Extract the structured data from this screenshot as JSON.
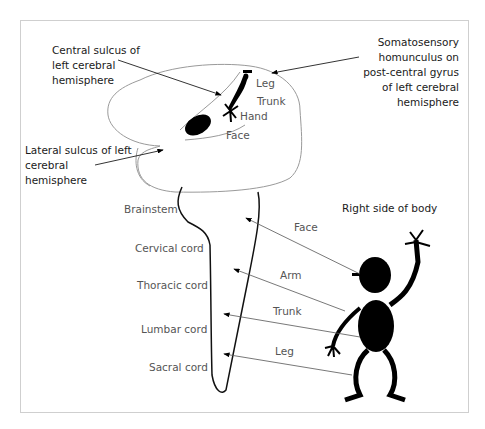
{
  "diagram": {
    "annotations": {
      "central_sulcus": [
        "Central sulcus of",
        "left cerebral",
        "hemisphere"
      ],
      "lateral_sulcus": [
        "Lateral sulcus of left",
        "cerebral",
        "hemisphere"
      ],
      "homunculus": [
        "Somatosensory",
        "homunculus on",
        "post-central gyrus",
        "of left cerebral",
        "hemisphere"
      ]
    },
    "cortex_regions": {
      "leg": "Leg",
      "trunk": "Trunk",
      "hand": "Hand",
      "face": "Face"
    },
    "spinal_levels": [
      "Brainstem",
      "Cervical cord",
      "Thoracic cord",
      "Lumbar cord",
      "Sacral cord"
    ],
    "body_title": "Right side of body",
    "body_parts": {
      "face": "Face",
      "arm": "Arm",
      "trunk": "Trunk",
      "leg": "Leg"
    },
    "colors": {
      "outline": "#888888",
      "ink": "#000000",
      "text": "#1a1a1a",
      "grey_text": "#555555",
      "frame": "#cfcfcf"
    }
  }
}
